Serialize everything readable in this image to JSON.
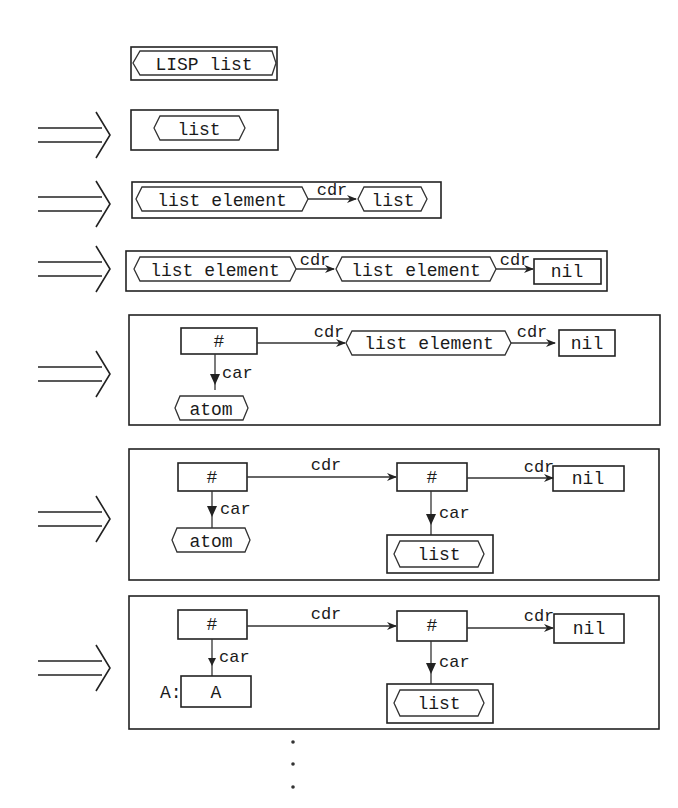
{
  "diagram": {
    "colors": {
      "ink": "#222222",
      "paper": "#ffffff"
    },
    "start": {
      "label": "LISP list",
      "shape": "hexagon-in-box"
    },
    "derivation_arrow_icon": "double-right-arrow",
    "steps": [
      {
        "id": "step1",
        "nodes": [
          {
            "label": "list",
            "shape": "hexagon"
          }
        ],
        "edges": []
      },
      {
        "id": "step2",
        "nodes": [
          {
            "label": "list element",
            "shape": "hexagon"
          },
          {
            "label": "list",
            "shape": "hexagon"
          }
        ],
        "edges": [
          {
            "from": 0,
            "to": 1,
            "label": "cdr"
          }
        ]
      },
      {
        "id": "step3",
        "nodes": [
          {
            "label": "list element",
            "shape": "hexagon"
          },
          {
            "label": "list element",
            "shape": "hexagon"
          },
          {
            "label": "nil",
            "shape": "rect"
          }
        ],
        "edges": [
          {
            "from": 0,
            "to": 1,
            "label": "cdr"
          },
          {
            "from": 1,
            "to": 2,
            "label": "cdr"
          }
        ]
      },
      {
        "id": "step4",
        "nodes": [
          {
            "label": "#",
            "shape": "rect"
          },
          {
            "label": "list element",
            "shape": "hexagon"
          },
          {
            "label": "nil",
            "shape": "rect"
          },
          {
            "label": "atom",
            "shape": "hexagon"
          }
        ],
        "edges": [
          {
            "from": 0,
            "to": 1,
            "label": "cdr"
          },
          {
            "from": 1,
            "to": 2,
            "label": "cdr"
          },
          {
            "from": 0,
            "to": 3,
            "label": "car"
          }
        ]
      },
      {
        "id": "step5",
        "nodes": [
          {
            "label": "#",
            "shape": "rect"
          },
          {
            "label": "#",
            "shape": "rect"
          },
          {
            "label": "nil",
            "shape": "rect"
          },
          {
            "label": "atom",
            "shape": "hexagon"
          },
          {
            "label": "list",
            "shape": "hexagon-in-box"
          }
        ],
        "edges": [
          {
            "from": 0,
            "to": 1,
            "label": "cdr"
          },
          {
            "from": 1,
            "to": 2,
            "label": "cdr"
          },
          {
            "from": 0,
            "to": 3,
            "label": "car"
          },
          {
            "from": 1,
            "to": 4,
            "label": "car"
          }
        ]
      },
      {
        "id": "step6",
        "nodes": [
          {
            "label": "#",
            "shape": "rect"
          },
          {
            "label": "#",
            "shape": "rect"
          },
          {
            "label": "nil",
            "shape": "rect"
          },
          {
            "label": "A",
            "shape": "rect",
            "prefix": "A:"
          },
          {
            "label": "list",
            "shape": "hexagon-in-box"
          }
        ],
        "edges": [
          {
            "from": 0,
            "to": 1,
            "label": "cdr"
          },
          {
            "from": 1,
            "to": 2,
            "label": "cdr"
          },
          {
            "from": 0,
            "to": 3,
            "label": "car"
          },
          {
            "from": 1,
            "to": 4,
            "label": "car"
          }
        ]
      }
    ],
    "continuation": "vertical-ellipsis"
  },
  "labels": {
    "start": "LISP list",
    "s1": {
      "n0": "list"
    },
    "s2": {
      "n0": "list element",
      "e0": "cdr",
      "n1": "list"
    },
    "s3": {
      "n0": "list element",
      "e0": "cdr",
      "n1": "list element",
      "e1": "cdr",
      "n2": "nil"
    },
    "s4": {
      "n0": "#",
      "e0": "cdr",
      "n1": "list element",
      "e1": "cdr",
      "n2": "nil",
      "car": "car",
      "n3": "atom"
    },
    "s5": {
      "n0": "#",
      "e0": "cdr",
      "n1": "#",
      "e1": "cdr",
      "n2": "nil",
      "car0": "car",
      "n3": "atom",
      "car1": "car",
      "n4": "list"
    },
    "s6": {
      "n0": "#",
      "e0": "cdr",
      "n1": "#",
      "e1": "cdr",
      "n2": "nil",
      "car0": "car",
      "prefix": "A:",
      "n3": "A",
      "car1": "car",
      "n4": "list"
    }
  }
}
